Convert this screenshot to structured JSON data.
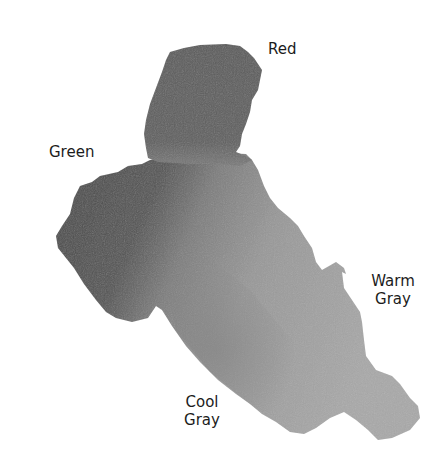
{
  "figure": {
    "type": "watercolor-blend-swatch",
    "background": "#ffffff",
    "labels": {
      "red": {
        "lines": [
          "Red"
        ]
      },
      "green": {
        "lines": [
          "Green"
        ]
      },
      "warm_gray": {
        "lines": [
          "Warm",
          "Gray"
        ]
      },
      "cool_gray": {
        "lines": [
          "Cool",
          "Gray"
        ]
      }
    },
    "regions": [
      {
        "name": "red",
        "tone": "#5a5a5a"
      },
      {
        "name": "green",
        "tone": "#4e4e4e"
      },
      {
        "name": "warm-gray",
        "tone": "#a3a3a3"
      },
      {
        "name": "cool-gray",
        "tone": "#8c8c8c"
      }
    ]
  }
}
